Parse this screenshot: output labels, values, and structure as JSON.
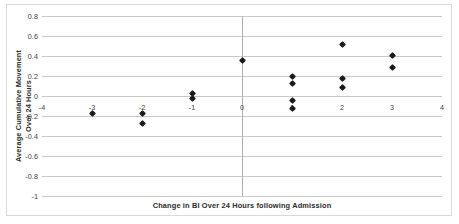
{
  "chart_data": {
    "type": "scatter",
    "title": "",
    "xlabel": "Change in BI Over 24 Hours following Admission",
    "ylabel_line1": "Average Cumulative Movement",
    "ylabel_line2": "Over 24 Hours",
    "xlim": [
      -4,
      4
    ],
    "ylim": [
      -1,
      0.8
    ],
    "xticks": [
      -4,
      -3,
      -2,
      -1,
      0,
      1,
      2,
      3,
      4
    ],
    "xtick_labels": [
      "-4",
      "-3",
      "-2",
      "-1",
      "0",
      "1",
      "2",
      "3",
      "4"
    ],
    "yticks": [
      0.8,
      0.6,
      0.4,
      0.2,
      0,
      -0.2,
      -0.4,
      -0.6,
      -0.8,
      -1
    ],
    "ytick_labels": [
      "0.8",
      "0.6",
      "0.4",
      "0.2",
      "0",
      "-0.2",
      "-0.4",
      "-0.6",
      "-0.8",
      "-1"
    ],
    "grid": "horizontal",
    "legend": "none",
    "marker_color": "#1a1a1a",
    "marker_shape": "diamond",
    "points": [
      {
        "x": -3,
        "y": -0.17
      },
      {
        "x": -2,
        "y": -0.17
      },
      {
        "x": -2,
        "y": -0.27
      },
      {
        "x": -1,
        "y": 0.03
      },
      {
        "x": -1,
        "y": -0.02
      },
      {
        "x": 0,
        "y": 0.36
      },
      {
        "x": 1,
        "y": 0.2
      },
      {
        "x": 1,
        "y": 0.13
      },
      {
        "x": 1,
        "y": -0.04
      },
      {
        "x": 1,
        "y": -0.12
      },
      {
        "x": 2,
        "y": 0.52
      },
      {
        "x": 2,
        "y": 0.18
      },
      {
        "x": 2,
        "y": 0.09
      },
      {
        "x": 3,
        "y": 0.41
      },
      {
        "x": 3,
        "y": 0.29
      }
    ]
  }
}
